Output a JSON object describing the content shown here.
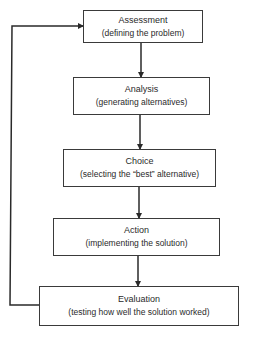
{
  "diagram": {
    "type": "flowchart",
    "colors": {
      "line": "#2a2a2a",
      "box_border": "#3a3a3a",
      "background": "#ffffff"
    },
    "steps": [
      {
        "title": "Assessment",
        "description": "(defining the problem)"
      },
      {
        "title": "Analysis",
        "description": "(generating alternatives)"
      },
      {
        "title": "Choice",
        "description": "(selecting the “best” alternative)"
      },
      {
        "title": "Action",
        "description": "(implementing the solution)"
      },
      {
        "title": "Evaluation",
        "description": "(testing how well the solution worked)"
      }
    ],
    "connections": [
      {
        "from": "Assessment",
        "to": "Analysis"
      },
      {
        "from": "Analysis",
        "to": "Choice"
      },
      {
        "from": "Choice",
        "to": "Action"
      },
      {
        "from": "Action",
        "to": "Evaluation"
      },
      {
        "from": "Evaluation",
        "to": "Assessment",
        "kind": "feedback-loop"
      }
    ]
  }
}
